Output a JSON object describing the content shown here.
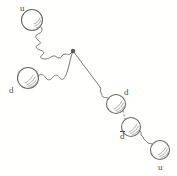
{
  "figure": {
    "type": "feynman-quark-diagram",
    "title": "",
    "background_color": "#fffffe",
    "ink_color": "#4a4a4a",
    "width": 177,
    "height": 176
  },
  "particles": [
    {
      "id": "u-top-left",
      "label": "u",
      "overbar": false,
      "cx": 32,
      "cy": 20,
      "r": 10.5
    },
    {
      "id": "d-left",
      "label": "d",
      "overbar": false,
      "cx": 28,
      "cy": 78,
      "r": 10.5
    },
    {
      "id": "d-middle",
      "label": "d",
      "overbar": false,
      "cx": 116,
      "cy": 104,
      "r": 9.5
    },
    {
      "id": "dbar-lower",
      "label": "d",
      "overbar": true,
      "cx": 131,
      "cy": 127,
      "r": 9.5
    },
    {
      "id": "u-bottom-right",
      "label": "u",
      "overbar": false,
      "cx": 160,
      "cy": 150,
      "r": 9.5
    }
  ],
  "labels": [
    {
      "id": "label-u-top-left",
      "text": "u",
      "overbar": false,
      "x": 20,
      "y": 4
    },
    {
      "id": "label-d-left",
      "text": "d",
      "overbar": false,
      "x": 9,
      "y": 86
    },
    {
      "id": "label-d-middle",
      "text": "d",
      "overbar": false,
      "x": 124,
      "y": 88
    },
    {
      "id": "label-dbar-lower",
      "text": "d",
      "overbar": true,
      "x": 120,
      "y": 132
    },
    {
      "id": "label-u-bottom-right",
      "text": "u",
      "overbar": false,
      "x": 158,
      "y": 163
    }
  ],
  "vertex": {
    "id": "interaction-vertex",
    "x": 73,
    "y": 51,
    "r": 2.2
  },
  "connectors": [
    {
      "id": "gluon-u-to-vertex",
      "style": "wavy",
      "from": "u-top-left",
      "to": "interaction-vertex"
    },
    {
      "id": "gluon-d-to-vertex",
      "style": "wavy",
      "from": "d-left",
      "to": "interaction-vertex"
    },
    {
      "id": "propagator-vertex-to-d",
      "style": "straight",
      "from": "interaction-vertex",
      "to": "d-middle"
    },
    {
      "id": "dotted-d-to-dbar",
      "style": "dotted",
      "from": "d-middle",
      "to": "dbar-lower"
    },
    {
      "id": "gluon-dbar-to-u",
      "style": "wavy",
      "from": "dbar-lower",
      "to": "u-bottom-right"
    }
  ]
}
